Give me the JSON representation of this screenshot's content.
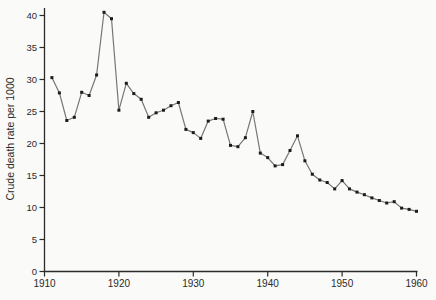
{
  "figure": {
    "background": "#fafaf8"
  },
  "chart_data": {
    "type": "line",
    "title": "",
    "xlabel": "",
    "ylabel": "Crude death rate per 1000",
    "series_name": "crude-death-rate",
    "x": [
      1911,
      1912,
      1913,
      1914,
      1915,
      1916,
      1917,
      1918,
      1919,
      1920,
      1921,
      1922,
      1923,
      1924,
      1925,
      1926,
      1927,
      1928,
      1929,
      1930,
      1931,
      1932,
      1933,
      1934,
      1935,
      1936,
      1937,
      1938,
      1939,
      1940,
      1941,
      1942,
      1943,
      1944,
      1945,
      1946,
      1947,
      1948,
      1949,
      1950,
      1951,
      1952,
      1953,
      1954,
      1955,
      1956,
      1957,
      1958,
      1959,
      1960
    ],
    "values": [
      30.3,
      27.9,
      23.6,
      24.1,
      28.0,
      27.5,
      30.7,
      40.5,
      39.5,
      25.2,
      29.4,
      27.8,
      26.9,
      24.1,
      24.8,
      25.2,
      25.9,
      26.4,
      22.2,
      21.7,
      20.8,
      23.5,
      23.9,
      23.8,
      19.7,
      19.5,
      20.9,
      25.0,
      18.5,
      17.8,
      16.5,
      16.7,
      18.9,
      21.2,
      17.3,
      15.2,
      14.3,
      13.9,
      12.9,
      14.2,
      12.9,
      12.4,
      12.0,
      11.5,
      11.1,
      10.7,
      10.9,
      9.9,
      9.7,
      9.4
    ],
    "x_ticks": [
      1910,
      1920,
      1930,
      1940,
      1950,
      1960
    ],
    "y_ticks": [
      0,
      5,
      10,
      15,
      20,
      25,
      30,
      35,
      40
    ],
    "xlim": [
      1910,
      1960
    ],
    "ylim": [
      0,
      40
    ],
    "grid": false,
    "legend": "none",
    "line_color": "#767676",
    "marker_color": "#1c1c1c",
    "axis_color": "#2b2b2b",
    "marker_shape": "square"
  }
}
